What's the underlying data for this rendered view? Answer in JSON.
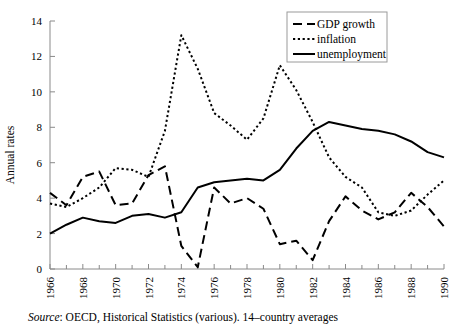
{
  "figure": {
    "source_note_label": "Source",
    "source_note_text": ": OECD, Historical Statistics (various). 14–country averages"
  },
  "chart_data": {
    "type": "line",
    "title": "",
    "xlabel": "",
    "ylabel": "Annual rates",
    "xlim": [
      1966,
      1990
    ],
    "ylim": [
      0,
      14
    ],
    "ytick_values": [
      0,
      2,
      4,
      6,
      8,
      10,
      12,
      14
    ],
    "ytick_labels": [
      "0",
      "2",
      "4",
      "6",
      "8",
      "10",
      "12",
      "14"
    ],
    "xtick_values": [
      1966,
      1968,
      1970,
      1972,
      1974,
      1976,
      1978,
      1980,
      1982,
      1984,
      1986,
      1988,
      1990
    ],
    "xtick_labels": [
      "1966",
      "1968",
      "1970",
      "1972",
      "1974",
      "1976",
      "1978",
      "1980",
      "1982",
      "1984",
      "1986",
      "1988",
      "1990"
    ],
    "xtick_minor_values": [
      1967,
      1969,
      1971,
      1973,
      1975,
      1977,
      1979,
      1981,
      1983,
      1985,
      1987,
      1989
    ],
    "grid": false,
    "legend_position": "top-right",
    "x": [
      1966,
      1967,
      1968,
      1969,
      1970,
      1971,
      1972,
      1973,
      1974,
      1975,
      1976,
      1977,
      1978,
      1979,
      1980,
      1981,
      1982,
      1983,
      1984,
      1985,
      1986,
      1987,
      1988,
      1989,
      1990
    ],
    "series": [
      {
        "name": "GDP growth",
        "style": "dashed",
        "values": [
          4.3,
          3.6,
          5.2,
          5.5,
          3.6,
          3.7,
          5.3,
          5.8,
          1.3,
          0.1,
          4.6,
          3.7,
          4.0,
          3.4,
          1.4,
          1.6,
          0.5,
          2.7,
          4.1,
          3.3,
          2.8,
          3.2,
          4.3,
          3.5,
          2.4
        ]
      },
      {
        "name": "inflation",
        "style": "dotted",
        "values": [
          3.7,
          3.5,
          4.0,
          4.6,
          5.7,
          5.6,
          5.2,
          7.8,
          13.2,
          11.3,
          8.8,
          8.1,
          7.3,
          8.5,
          11.5,
          10.1,
          8.3,
          6.3,
          5.2,
          4.6,
          3.2,
          3.0,
          3.3,
          4.2,
          5.0
        ]
      },
      {
        "name": "unemployment",
        "style": "solid",
        "values": [
          2.0,
          2.5,
          2.9,
          2.7,
          2.6,
          3.0,
          3.1,
          2.9,
          3.2,
          4.6,
          4.9,
          5.0,
          5.1,
          5.0,
          5.6,
          6.8,
          7.8,
          8.3,
          8.1,
          7.9,
          7.8,
          7.6,
          7.2,
          6.6,
          6.3
        ]
      }
    ]
  }
}
